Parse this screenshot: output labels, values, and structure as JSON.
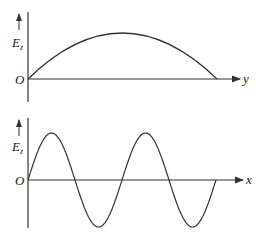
{
  "figure": {
    "panels": [
      {
        "id": "top",
        "vertical_label": "E",
        "vertical_label_subscript": "z",
        "origin_label": "O",
        "horizontal_label": "y",
        "curve": "half-period sine arch (standing wave across y)"
      },
      {
        "id": "bottom",
        "vertical_label": "E",
        "vertical_label_subscript": "z",
        "origin_label": "O",
        "horizontal_label": "x",
        "curve": "two full periods of sine wave along x"
      }
    ],
    "colors": {
      "line": "#333333",
      "background": "#ffffff"
    }
  }
}
